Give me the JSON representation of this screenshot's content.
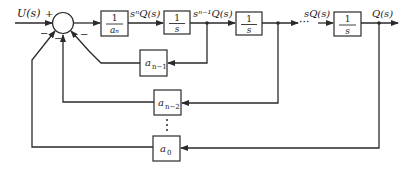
{
  "diagram": {
    "type": "block-diagram",
    "signals": {
      "input": "U(s)",
      "after_gain": "sⁿQ(s)",
      "after_int1": "sⁿ⁻¹Q(s)",
      "before_last": "sQ(s)",
      "output": "Q(s)"
    },
    "summing_junction": {
      "signs": {
        "input": "+",
        "fb1": "−",
        "fb2": "−",
        "fb3": "−"
      }
    },
    "forward_blocks": [
      {
        "id": "gain",
        "num": "1",
        "den": "aₙ"
      },
      {
        "id": "int1",
        "num": "1",
        "den": "s"
      },
      {
        "id": "int2",
        "num": "1",
        "den": "s"
      },
      {
        "id": "int3",
        "num": "1",
        "den": "s"
      }
    ],
    "feedback_blocks": [
      {
        "id": "fb-an1",
        "label": "a",
        "sub": "n−1"
      },
      {
        "id": "fb-an2",
        "label": "a",
        "sub": "n−2"
      },
      {
        "id": "fb-a0",
        "label": "a",
        "sub": "0"
      }
    ],
    "ellipsis_horizontal": "···",
    "ellipsis_vertical": "⋮"
  }
}
